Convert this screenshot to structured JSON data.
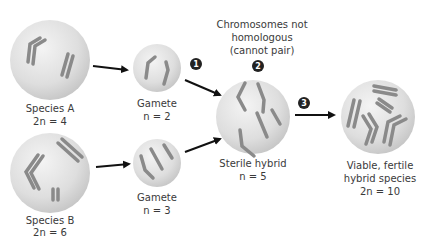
{
  "cells": {
    "species_a": {
      "name": "Species A",
      "ploidy": "2n = 4"
    },
    "species_b": {
      "name": "Species B",
      "ploidy": "2n = 6"
    },
    "gamete_a": {
      "name": "Gamete",
      "ploidy": "n = 2"
    },
    "gamete_b": {
      "name": "Gamete",
      "ploidy": "n = 3"
    },
    "sterile_hybrid": {
      "name": "Sterile hybrid",
      "ploidy": "n = 5"
    },
    "fertile_hybrid": {
      "name_line1": "Viable, fertile",
      "name_line2": "hybrid species",
      "ploidy": "2n = 10"
    }
  },
  "annotation": {
    "line1": "Chromosomes not",
    "line2": "homologous",
    "line3": "(cannot pair)"
  },
  "steps": [
    "1",
    "2",
    "3"
  ],
  "colors": {
    "cell_fill": "#dcdcdc",
    "chromosome": "#8c8c8c",
    "arrow": "#111111",
    "badge": "#222222",
    "text": "#3a3a3a"
  }
}
